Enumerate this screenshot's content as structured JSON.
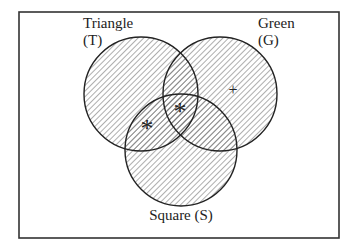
{
  "diagram": {
    "type": "venn",
    "frame": {
      "x": 19,
      "y": 12,
      "width": 320,
      "height": 226
    },
    "circles": [
      {
        "id": "triangle",
        "label_line1": "Triangle",
        "label_line2": "(T)",
        "cx": 141,
        "cy": 94,
        "r": 57
      },
      {
        "id": "green",
        "label_line1": "Green",
        "label_line2": "(G)",
        "cx": 220,
        "cy": 94,
        "r": 57
      },
      {
        "id": "square",
        "label_line1": "Square (S)",
        "cx": 181,
        "cy": 150,
        "r": 56
      }
    ],
    "markers": [
      {
        "symbol": "*",
        "region": "triangle-and-square-only",
        "x": 147,
        "y": 127
      },
      {
        "symbol": "*",
        "region": "triangle-green-square",
        "x": 180,
        "y": 110
      },
      {
        "symbol": "+",
        "region": "green-only",
        "x": 233,
        "y": 89
      }
    ],
    "colors": {
      "stroke": "#222222",
      "hatch": "#777777",
      "background": "#ffffff"
    }
  }
}
